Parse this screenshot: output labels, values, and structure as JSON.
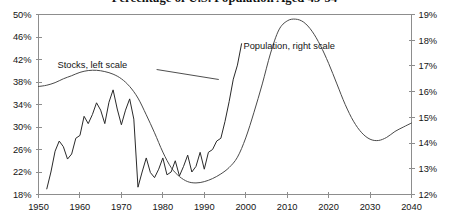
{
  "chart_data": {
    "type": "line",
    "title": "Percentage of U.S. Population Aged 45-54",
    "xlabel": "",
    "ylabel": "",
    "grid": false,
    "legend_position": "inline-annotations",
    "xlim": [
      1950,
      2040
    ],
    "xticks": [
      "1950",
      "1960",
      "1970",
      "1980",
      "1990",
      "2000",
      "2010",
      "2020",
      "2030",
      "2040"
    ],
    "xtick_values": [
      1950,
      1960,
      1970,
      1980,
      1990,
      2000,
      2010,
      2020,
      2030,
      2040
    ],
    "left_axis": {
      "label": "",
      "ylim": [
        18,
        50
      ],
      "ticks": [
        "18%",
        "22%",
        "26%",
        "30%",
        "34%",
        "38%",
        "42%",
        "46%",
        "50%"
      ],
      "tick_values": [
        18,
        22,
        26,
        30,
        34,
        38,
        42,
        46,
        50
      ]
    },
    "right_axis": {
      "label": "",
      "ylim": [
        12,
        19
      ],
      "ticks": [
        "12%",
        "13%",
        "14%",
        "15%",
        "16%",
        "17%",
        "18%",
        "19%"
      ],
      "tick_values": [
        12,
        13,
        14,
        15,
        16,
        17,
        18,
        19
      ]
    },
    "annotations": [
      {
        "text": "Stocks, left scale",
        "x": 1963.0,
        "y_px": 68,
        "leader_from": [
          1978.5,
          69.5
        ],
        "leader_to": [
          1993.5,
          79.5
        ]
      },
      {
        "text": "Population, right scale",
        "x": 2010.5,
        "y_px": 49,
        "leader_from": null,
        "leader_to": null
      }
    ],
    "series": [
      {
        "name": "Stocks, left scale",
        "axis": "left",
        "x": [
          1952,
          1953,
          1954,
          1955,
          1956,
          1957,
          1958,
          1959,
          1960,
          1961,
          1962,
          1963,
          1964,
          1965,
          1966,
          1967,
          1968,
          1969,
          1970,
          1971,
          1972,
          1973,
          1974,
          1975,
          1976,
          1977,
          1978,
          1979,
          1980,
          1981,
          1982,
          1983,
          1984,
          1985,
          1986,
          1987,
          1988,
          1989,
          1990,
          1991,
          1992,
          1993,
          1994,
          1995,
          1996,
          1997,
          1998,
          1999
        ],
        "values": [
          19.0,
          22.0,
          25.7,
          27.5,
          26.5,
          24.3,
          25.2,
          28.0,
          28.5,
          31.9,
          30.6,
          32.2,
          34.3,
          33.0,
          30.6,
          34.4,
          36.6,
          33.2,
          30.4,
          33.0,
          35.0,
          31.4,
          19.3,
          22.0,
          24.5,
          21.9,
          21.0,
          22.5,
          24.5,
          21.5,
          22.0,
          24.0,
          21.3,
          23.0,
          25.0,
          22.0,
          23.0,
          25.5,
          22.5,
          25.5,
          26.0,
          27.5,
          28.0,
          31.0,
          34.5,
          38.5,
          41.0,
          44.8
        ]
      },
      {
        "name": "Population, right scale",
        "axis": "right",
        "x": [
          1950,
          1952,
          1954,
          1956,
          1958,
          1960,
          1962,
          1964,
          1966,
          1968,
          1970,
          1972,
          1974,
          1976,
          1978,
          1980,
          1982,
          1984,
          1986,
          1988,
          1990,
          1992,
          1994,
          1996,
          1998,
          2000,
          2002,
          2004,
          2006,
          2008,
          2010,
          2012,
          2014,
          2016,
          2018,
          2020,
          2022,
          2024,
          2026,
          2028,
          2030,
          2032,
          2034,
          2036,
          2038,
          2040
        ],
        "values": [
          16.2,
          16.25,
          16.35,
          16.5,
          16.62,
          16.75,
          16.82,
          16.83,
          16.78,
          16.68,
          16.5,
          16.2,
          15.75,
          15.1,
          14.4,
          13.65,
          13.05,
          12.7,
          12.5,
          12.45,
          12.5,
          12.62,
          12.8,
          13.05,
          13.45,
          14.2,
          15.2,
          16.3,
          17.5,
          18.4,
          18.75,
          18.82,
          18.7,
          18.35,
          17.8,
          17.1,
          16.3,
          15.5,
          14.85,
          14.4,
          14.15,
          14.1,
          14.22,
          14.45,
          14.62,
          14.78
        ]
      }
    ]
  }
}
